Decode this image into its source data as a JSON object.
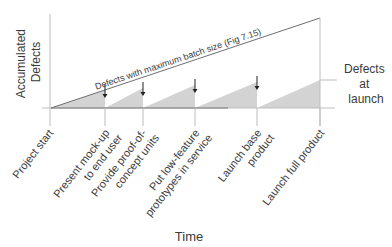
{
  "diagram": {
    "y_axis_label": [
      "Accumulated",
      "Defects"
    ],
    "x_axis_label": "Time",
    "max_batch_line_label": "Defects with maximum batch size (Fig 7.15)",
    "side_label": [
      "Defects",
      "at",
      "launch"
    ],
    "colors": {
      "fill": "#d3d3d3",
      "line": "#6e6e6e",
      "axis": "#bdbdbd",
      "text": "#3a3a3a"
    },
    "milestones": [
      {
        "id": "project-start",
        "lines": [
          "Project start"
        ]
      },
      {
        "id": "present-mockup",
        "lines": [
          "Present  mock-up",
          "to end user"
        ]
      },
      {
        "id": "proof-of-concept",
        "lines": [
          "Provide proof-of-",
          "concept units"
        ]
      },
      {
        "id": "low-feature-prototypes",
        "lines": [
          "Put low-feature",
          "prototypes in service"
        ]
      },
      {
        "id": "launch-base",
        "lines": [
          "Launch base",
          "product"
        ]
      },
      {
        "id": "launch-full",
        "lines": [
          "Launch  full product"
        ]
      }
    ],
    "defect_reset_arrows": 4
  }
}
